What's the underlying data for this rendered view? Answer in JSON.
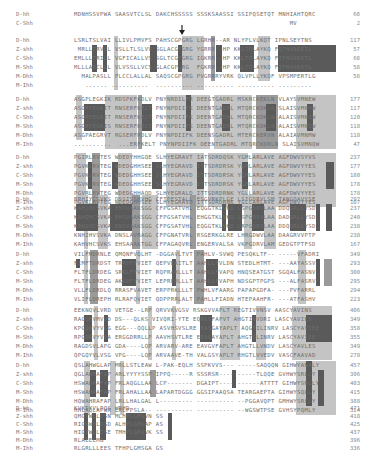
{
  "figure": {
    "type": "protein sequence alignment",
    "marker": "arrow-down",
    "species": [
      "D-hh",
      "Z-shh",
      "C-Shh",
      "M-Shh",
      "M-Dhh",
      "M-Ihh"
    ],
    "blocks": [
      {
        "rows": [
          {
            "name": "D-hh",
            "seq": "MDNHSSVPWA SAASVTCLSL DAKCHSSSSS SSSKSAASSI SSIPQSETQT MNHIAHTQRC",
            "num": "60"
          },
          {
            "name": "C-Shh",
            "seq": "                                                          MV",
            "num": "2"
          }
        ]
      },
      {
        "rows": [
          {
            "name": "D-hh",
            "seq": "LSRLTSLVAI LLIVLPMVFS PAHSCGPGRG LGRHR--AR NLYPLVLKQT IPNLSEYTNS",
            "num": "117"
          },
          {
            "name": "Z-shh",
            "seq": " MRLLTRVLL VSLLTLSLVV SGLACGPGRG YGRRR--HP KKLTPLAYKQ FIPNVAEKTL",
            "num": "57"
          },
          {
            "name": "C-Shh",
            "seq": "EMLLLTRILL VGFICALLVS SGLTCGPGRG IGKRR--HP KKLTPLAYKQ FIPNVAEKTL",
            "num": "60"
          },
          {
            "name": "M-Shh",
            "seq": "MLLLARCLLL VLVSSLLVCS GLACGPGRG  FGKRR--HP KKLTPLAYKQ FIPNVAEKTL",
            "num": "58"
          },
          {
            "name": "M-Dhh",
            "seq": "  MALPASLL PLCCLALLAL SAQSCGPGRG PVGRRRYVRK QLVPLLYKQF VPSMPERTLG",
            "num": "58"
          },
          {
            "name": "M-Ihh",
            "seq": "   ...... ..........  .......... .......... .......... .........",
            "num": ""
          }
        ]
      },
      {
        "rows": [
          {
            "name": "D-hh",
            "seq": "ASGPLEGKIK RDSPKFKDLV PNYNRDILFR DEEGTGADRL MSKRCKEKLN VLAYSVMNEW",
            "num": "177"
          },
          {
            "name": "Z-shh",
            "seq": "ASGRYEGKIT RNSERFKELT PNYNPDIIFK DEENTGADRL MTQRCKDKLN SLAISVMNHW",
            "num": "117"
          },
          {
            "name": "C-Shh",
            "seq": "ASGRYEGKIT RNSERFKELT PNYNPDIIFK DEENTGADRL MTQRCKDKLN ALAISVMNQW",
            "num": "120"
          },
          {
            "name": "M-Shh",
            "seq": "ASGRYEGKIS RNSERFKELT PNYNPDIIFK DEENTGADRL MTQRCKDKLN ALAISVMNQW",
            "num": "118"
          },
          {
            "name": "M-Dhh",
            "seq": "ASGPAEGRVT RGSERFRDLV PNYNPDIIFK DEENSGADRL MTERCKERVN ALAIAVMNMW",
            "num": "118"
          },
          {
            "name": "M-Ihh",
            "seq": "..........  ...ERFKELT PNYNPDIIFK DEENTGADRL MTQRCKDRLN SLAISVMNQW",
            "num": "47"
          }
        ]
      },
      {
        "rows": [
          {
            "name": "D-hh",
            "seq": "PGIRLRVTES WDEDYHHGQE SLHYEGRAVT IATSDRDQSK YGMLARLAVE AGFDWVSYVS",
            "num": "237"
          },
          {
            "name": "Z-shh",
            "seq": "PGVKLRVTEG WDEDGHHSEE SLHYEGRAVD ITTSDRDRSK YGMLARLAVE AGFDWVYYES",
            "num": "177"
          },
          {
            "name": "C-Shh",
            "seq": "PGVKLRVTEG WDEDGHHSEE SLHYEGRAVD ITTSDRDRSK YGMLARLAVE AGFDWVYYES",
            "num": "180"
          },
          {
            "name": "M-Shh",
            "seq": "PGVKLRVTEG WDEDGHHSEE SLHYEGRAVD ITTSDRDRSK YGMLARLAVE AGFDWVYYES",
            "num": "178"
          },
          {
            "name": "M-Dhh",
            "seq": "PGVRLRVTEG WDEDGHHAQD SLHYEGRALD ITTSDRDRNK YGLLARLAVE AGFDWVYYES",
            "num": "178"
          },
          {
            "name": "M-Ihh",
            "seq": "PGVKLRVTEG WDEDGHHSEE SLHYEGRAVD ITTSDRDRNK YGLLARLAVE AGFDWVYYES",
            "num": "107"
          }
        ]
      },
      {
        "rows": [
          {
            "name": "D-hh",
            "seq": "RRHIYCSVKS DSSISSHVHG CFTPESTALL ESGVRKPLGE LSIGDRVLSM TANGQAVYSE",
            "num": "297"
          },
          {
            "name": "Z-shh",
            "seq": "KAHIHCSVKA ENSVAAKSGG CFPGSATVHL EQGGTKLVKD LSPGDRVLAA DDQGRLLYSD",
            "num": "237"
          },
          {
            "name": "C-Shh",
            "seq": "KAHIHCSVKA EHSVAAKSGG CFPGSATVHL EHGGTKLVKD LSPGDRVLAA DADGRLLYSD",
            "num": "240"
          },
          {
            "name": "M-Shh",
            "seq": "KAHIHCSVKA ENSVAAKSGG CFPGSATVHL EQGGTKLVKD LRPGDRVLAA DDQGRLLYSD",
            "num": "238"
          },
          {
            "name": "M-Dhh",
            "seq": "KNHIHVSVKA DNSLAVRAGG CFPGNATVRL RSGERKGLRE LHRGDWVLAA DAAGRVVPTP",
            "num": "238"
          },
          {
            "name": "M-Ihh",
            "seq": "KAHVHCSVKS EHSAAAKTGG CFPAGAQVRL ENGERVALSA VKPGDRVLAM GEDGTPTFSD",
            "num": "167"
          }
        ]
      },
      {
        "rows": [
          {
            "name": "D-hh",
            "seq": "VILFMDRNLE QMQNFVQLHT -DGGAVLTVT PAHLV-SVWQ PESQKLTF-- -----VFADRI",
            "num": "349"
          },
          {
            "name": "Z-shh",
            "seq": "FIMFTDRDST TRRVFYVIET QEPVEKITLT AAHLLFVLDN STEDLHTMT- ---AAYASSV",
            "num": "293"
          },
          {
            "name": "C-Shh",
            "seq": "FLTFLDRDEG SRKLFYVIET RQPRARLLLT AAHLLFVAPQ HNQSEATGST SGQALFASNV",
            "num": "300"
          },
          {
            "name": "M-Shh",
            "seq": "FLTFLDRDEG AKKVFYVIET LEPRERLLLT AAHLLFVAPH NDSGPTPGPS ---ALFASRV",
            "num": "295"
          },
          {
            "name": "M-Dhh",
            "seq": "VLLFLDRDLQ RRASFVAVET ERPPRKLLLT PWHLVFAARG PAPAPGDFA- ---PVFARRL",
            "num": "294"
          },
          {
            "name": "M-Ihh",
            "seq": "VLIFLDREPH RLRAFQVIET QDPPRRLALT PAHLLFIADN HTEPAAHFR- ---ATFASHV",
            "num": "223"
          }
        ]
      },
      {
        "rows": [
          {
            "name": "D-hh",
            "seq": "EEKNQVLVRD VETGE--LRP QRVVKVGSV RSKGVVAPLT REGTIVVNSV AASCYAVINS",
            "num": "406"
          },
          {
            "name": "Z-shh",
            "seq": "RAGQRVMVVD DS---QLKS VIVQRI-YTE EQRGSFAPVT AHGTIVVDRI LASCYAVIED",
            "num": "349"
          },
          {
            "name": "C-Shh",
            "seq": "KPGQRVYVLG EGG---QQLLP ASVHSVSLRE EASGAYAPLT AQGTILINRV LASCYAVIEE",
            "num": "358"
          },
          {
            "name": "M-Shh",
            "seq": "RPGQRVYVVA ERGGDRRLLP AAVHSVTLRE EEAGAYAPLT AHGTILINRV LASCYAVIEE",
            "num": "355"
          },
          {
            "name": "M-Dhh",
            "seq": "RAGDSVLAPG GDA----LQP ARVARV-ARE EAVGVFAPLT AHGTLLVNDV LASCYAVLES",
            "num": "349"
          },
          {
            "name": "M-Ihh",
            "seq": "QPGQYVLVSG VPG----LQP ARVAAVE-TH VALGSYAPLT RHGTLVVEDV VASCFAAVAD",
            "num": "278"
          }
        ]
      },
      {
        "rows": [
          {
            "name": "D-hh",
            "seq": "QSLAHWGLAP MRLLSTLEAW L-PAK-EQLH SSPKVVS--- -----SAQQQN GIHWYANALY",
            "num": "457"
          },
          {
            "name": "Z-shh",
            "seq": "QGLAHRAFAP ARLYYYYSSP IPPQ-----R SSSRSR---- -----TLQQE GVHWYSRLLY",
            "num": "396"
          },
          {
            "name": "C-Shh",
            "seq": "HSWAHRAFAP FRLAQGLLAA LCP------- DGAIPT---- ------ATTTT GIHWYSRLLY",
            "num": "403"
          },
          {
            "name": "M-Shh",
            "seq": "HSWAHRAFAP FRLAHALLAA LAPARTDGGG GGSIPAAQSA TEARGAEPTA GIHWYSQLLY",
            "num": "415"
          },
          {
            "name": "M-Dhh",
            "seq": "HQWAHRAFAP LRLLHALGAL L--------- ---------- --PGGAVQPT GMHWYSRLLY",
            "num": "388"
          },
          {
            "name": "M-Ihh",
            "seq": "HHLAQLAPWR LRLPPSLA-- ---------- ---------- --WGSWTPSE GVHSYPQMLY",
            "num": "314"
          }
        ]
      },
      {
        "rows": [
          {
            "name": "D-hh",
            "seq": "KVKDYVLPQS WRHD",
            "num": "471"
          },
          {
            "name": "Z-shh",
            "seq": "QMGTWLLDSN MLHPLGMSVN SS",
            "num": "418"
          },
          {
            "name": "C-Shh",
            "seq": "RIGSWVLDGD ALHPLGMVAP AS",
            "num": "425"
          },
          {
            "name": "M-Shh",
            "seq": "HIGTWLLDSE TMHPLGMAVK SS",
            "num": "437"
          },
          {
            "name": "M-Dhh",
            "seq": "RLAEELMG",
            "num": "396"
          },
          {
            "name": "M-Ihh",
            "seq": "RLGRLLLEES TFHPLGMSGA GS",
            "num": "336"
          }
        ]
      }
    ]
  }
}
